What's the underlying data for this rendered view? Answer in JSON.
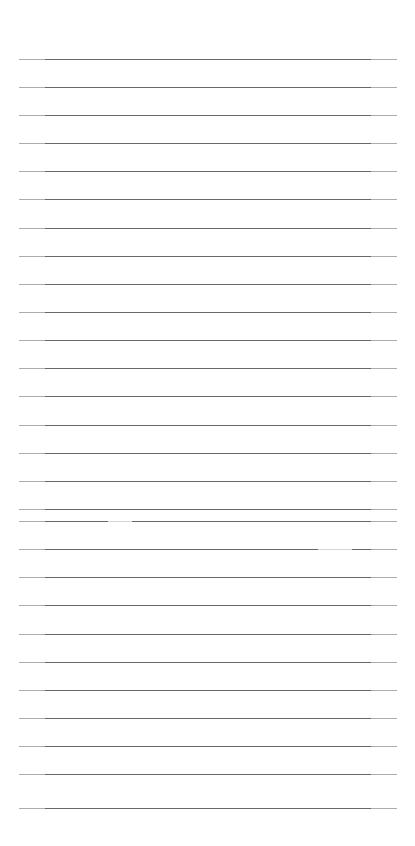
{
  "page": {
    "kind": "scanned-ruled-notebook-page",
    "width": 415,
    "height": 846,
    "background_color": "#ffffff",
    "content_text": "",
    "handwriting_present": "none",
    "printed_text_present": "none"
  },
  "ruling": {
    "line_color": "#5a5d60",
    "line_thickness_px": 1,
    "line_count": 28,
    "spacing_px": 28.1,
    "left_edge_px": 19,
    "right_edge_px": 397,
    "line_length_px": 378,
    "first_line_y_px": 59,
    "last_line_y_px": 808,
    "lines_y": [
      59,
      87,
      115,
      143,
      171,
      199,
      228,
      256,
      284,
      312,
      340,
      368,
      396,
      425,
      453,
      481,
      509,
      521,
      549,
      577,
      605,
      634,
      662,
      690,
      718,
      746,
      774,
      808
    ]
  },
  "margins": {
    "top_px": 59,
    "bottom_px": 37,
    "left_px": 19,
    "right_px": 18
  },
  "scan_artifacts": [
    {
      "name": "dropout-upper",
      "line_y_px": 521,
      "start_x_px": 108,
      "end_x_px": 132
    },
    {
      "name": "dropout-lower",
      "line_y_px": 549,
      "start_x_px": 318,
      "end_x_px": 352
    }
  ],
  "labels": {
    "page_region": "page",
    "rule_region": "ruled-lines",
    "top_margin": "top-margin",
    "bottom_margin": "bottom-margin"
  }
}
